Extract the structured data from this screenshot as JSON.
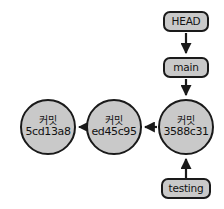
{
  "diagram": {
    "background_color": "#ffffff",
    "node_fill_color": "#c9c9c9",
    "node_stroke_color": "#1a1a1a",
    "edge_color": "#1a1a1a",
    "commits": [
      {
        "id": "commit-5cd13a8",
        "type_label": "커밋",
        "hash": "5cd13a8",
        "x": 48,
        "y": 127
      },
      {
        "id": "commit-ed45c95",
        "type_label": "커밋",
        "hash": "ed45c95",
        "x": 114,
        "y": 127
      },
      {
        "id": "commit-3588c31",
        "type_label": "커밋",
        "hash": "3588c31",
        "x": 186,
        "y": 127
      }
    ],
    "refs": [
      {
        "id": "ref-head",
        "label": "HEAD",
        "x": 186,
        "y": 22
      },
      {
        "id": "ref-main",
        "label": "main",
        "x": 186,
        "y": 68
      },
      {
        "id": "ref-testing",
        "label": "testing",
        "x": 186,
        "y": 189
      }
    ],
    "edges": [
      {
        "id": "edge-head-to-main",
        "from": "HEAD",
        "to": "main",
        "direction": "down"
      },
      {
        "id": "edge-main-to-3588c31",
        "from": "main",
        "to": "3588c31",
        "direction": "down"
      },
      {
        "id": "edge-testing-to-3588c31",
        "from": "testing",
        "to": "3588c31",
        "direction": "up"
      },
      {
        "id": "edge-3588c31-to-ed45c95",
        "from": "3588c31",
        "to": "ed45c95",
        "direction": "left"
      },
      {
        "id": "edge-ed45c95-to-5cd13a8",
        "from": "ed45c95",
        "to": "5cd13a8",
        "direction": "left"
      }
    ]
  }
}
